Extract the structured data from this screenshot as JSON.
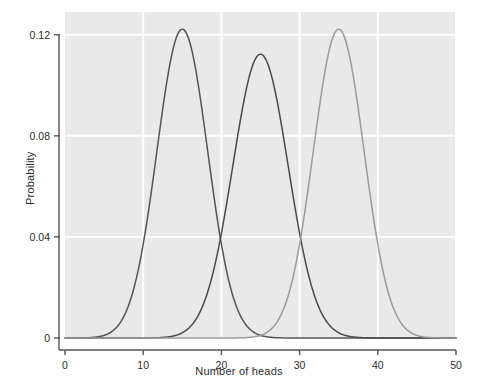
{
  "chart_data": {
    "type": "line",
    "title": "",
    "xlabel": "Number of heads",
    "ylabel": "Probability",
    "xlim": [
      0,
      50
    ],
    "ylim": [
      0,
      0.129
    ],
    "grid": true,
    "grid_color": "#ffffff",
    "plot_background": "#e9e9e9",
    "legend": "none",
    "xticks": [
      {
        "value": 0,
        "label": "0"
      },
      {
        "value": 10,
        "label": "10"
      },
      {
        "value": 20,
        "label": "20"
      },
      {
        "value": 30,
        "label": "30"
      },
      {
        "value": 40,
        "label": "40"
      },
      {
        "value": 50,
        "label": "50"
      }
    ],
    "yticks": [
      {
        "value": 0,
        "label": "0"
      },
      {
        "value": 0.04,
        "label": "0.04"
      },
      {
        "value": 0.08,
        "label": "0.08"
      },
      {
        "value": 0.12,
        "label": "0.12"
      }
    ],
    "series": [
      {
        "name": "p = 0.3",
        "color": "#555555",
        "mean": 15,
        "sd": 3.24,
        "peak_x": 15,
        "peak_y": 0.1222,
        "x": [
          0,
          1,
          2,
          3,
          4,
          5,
          6,
          7,
          8,
          9,
          10,
          11,
          12,
          13,
          14,
          15,
          16,
          17,
          18,
          19,
          20,
          21,
          22,
          23,
          24,
          25,
          26,
          27,
          28,
          29,
          30,
          31,
          32,
          33,
          34,
          35,
          36,
          37,
          38,
          39,
          40,
          41,
          42,
          43,
          44,
          45,
          46,
          47,
          48,
          49,
          50
        ],
        "values": [
          0.0,
          0.0,
          0.0,
          0.0001,
          0.0003,
          0.0012,
          0.0035,
          0.0085,
          0.0179,
          0.0329,
          0.0536,
          0.0782,
          0.1025,
          0.1215,
          0.1303,
          0.1272,
          0.1137,
          0.0933,
          0.0704,
          0.0489,
          0.0314,
          0.0186,
          0.0102,
          0.0052,
          0.0024,
          0.001,
          0.0004,
          0.0002,
          0.0001,
          0.0,
          0.0,
          0.0,
          0.0,
          0.0,
          0.0,
          0.0,
          0.0,
          0.0,
          0.0,
          0.0,
          0.0,
          0.0,
          0.0,
          0.0,
          0.0,
          0.0,
          0.0,
          0.0,
          0.0,
          0.0,
          0.0
        ]
      },
      {
        "name": "p = 0.5",
        "color": "#4a4a4a",
        "mean": 25,
        "sd": 3.54,
        "peak_x": 25,
        "peak_y": 0.1123,
        "x": [
          0,
          1,
          2,
          3,
          4,
          5,
          6,
          7,
          8,
          9,
          10,
          11,
          12,
          13,
          14,
          15,
          16,
          17,
          18,
          19,
          20,
          21,
          22,
          23,
          24,
          25,
          26,
          27,
          28,
          29,
          30,
          31,
          32,
          33,
          34,
          35,
          36,
          37,
          38,
          39,
          40,
          41,
          42,
          43,
          44,
          45,
          46,
          47,
          48,
          49,
          50
        ],
        "values": [
          0.0,
          0.0,
          0.0,
          0.0,
          0.0,
          0.0,
          0.0,
          0.0,
          0.0,
          0.0,
          0.0,
          0.0,
          0.0001,
          0.0002,
          0.0004,
          0.002,
          0.0044,
          0.0087,
          0.016,
          0.027,
          0.0419,
          0.0598,
          0.0788,
          0.096,
          0.108,
          0.1123,
          0.108,
          0.096,
          0.0788,
          0.0598,
          0.0419,
          0.027,
          0.016,
          0.0087,
          0.0044,
          0.002,
          0.0008,
          0.0003,
          0.0001,
          0.0,
          0.0,
          0.0,
          0.0,
          0.0,
          0.0,
          0.0,
          0.0,
          0.0,
          0.0,
          0.0,
          0.0
        ]
      },
      {
        "name": "p = 0.7",
        "color": "#9a9a9a",
        "mean": 35,
        "sd": 3.24,
        "peak_x": 35,
        "peak_y": 0.1222,
        "x": [
          0,
          1,
          2,
          3,
          4,
          5,
          6,
          7,
          8,
          9,
          10,
          11,
          12,
          13,
          14,
          15,
          16,
          17,
          18,
          19,
          20,
          21,
          22,
          23,
          24,
          25,
          26,
          27,
          28,
          29,
          30,
          31,
          32,
          33,
          34,
          35,
          36,
          37,
          38,
          39,
          40,
          41,
          42,
          43,
          44,
          45,
          46,
          47,
          48,
          49,
          50
        ],
        "values": [
          0.0,
          0.0,
          0.0,
          0.0,
          0.0,
          0.0,
          0.0,
          0.0,
          0.0,
          0.0,
          0.0,
          0.0,
          0.0,
          0.0,
          0.0,
          0.0,
          0.0,
          0.0,
          0.0,
          0.0,
          0.0,
          0.0002,
          0.0004,
          0.001,
          0.0024,
          0.0052,
          0.0102,
          0.0186,
          0.0314,
          0.0489,
          0.0704,
          0.0933,
          0.1137,
          0.1272,
          0.1303,
          0.1215,
          0.1025,
          0.0782,
          0.0536,
          0.0329,
          0.0179,
          0.0085,
          0.0035,
          0.0012,
          0.0003,
          0.0001,
          0.0,
          0.0,
          0.0,
          0.0,
          0.0
        ]
      }
    ]
  }
}
